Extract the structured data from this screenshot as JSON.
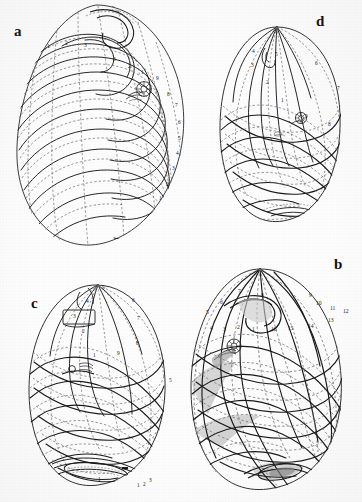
{
  "figure": {
    "kind": "scientific-illustration-plate",
    "background_color": "#ffffff",
    "line_color": "#1a1a1a",
    "dashed_line_color": "#6b6b6b",
    "shade_color": "#9a9a9a"
  },
  "panels": [
    {
      "id": "a",
      "letter": "a",
      "letter_x": 14,
      "letter_y": 31,
      "view": "apical-oblique",
      "labels": [
        {
          "text": "1",
          "x": 47,
          "y": 48
        },
        {
          "text": "2",
          "x": 65,
          "y": 45
        },
        {
          "text": "3",
          "x": 84,
          "y": 47
        },
        {
          "text": "3",
          "x": 113,
          "y": 61
        },
        {
          "text": "2",
          "x": 128,
          "y": 68
        },
        {
          "text": "1",
          "x": 141,
          "y": 74
        },
        {
          "text": "9",
          "x": 156,
          "y": 80
        },
        {
          "text": "8",
          "x": 167,
          "y": 96
        },
        {
          "text": "7",
          "x": 175,
          "y": 107
        },
        {
          "text": "6",
          "x": 178,
          "y": 124
        },
        {
          "text": "5",
          "x": 178,
          "y": 140
        },
        {
          "text": "4",
          "x": 176,
          "y": 155
        },
        {
          "text": "3",
          "x": 172,
          "y": 170
        },
        {
          "text": "2",
          "x": 166,
          "y": 186
        },
        {
          "text": "1",
          "x": 159,
          "y": 200
        }
      ]
    },
    {
      "id": "d",
      "letter": "d",
      "letter_x": 318,
      "letter_y": 28,
      "view": "lateral-upper",
      "labels": [
        {
          "text": "4",
          "x": 252,
          "y": 53
        },
        {
          "text": "5",
          "x": 275,
          "y": 56
        },
        {
          "text": "3",
          "x": 251,
          "y": 67
        },
        {
          "text": "2",
          "x": 266,
          "y": 84
        },
        {
          "text": "1",
          "x": 281,
          "y": 102
        },
        {
          "text": "6",
          "x": 315,
          "y": 65
        },
        {
          "text": "7",
          "x": 337,
          "y": 90
        },
        {
          "text": "8",
          "x": 328,
          "y": 126
        },
        {
          "text": "9",
          "x": 305,
          "y": 118
        }
      ]
    },
    {
      "id": "c",
      "letter": "c",
      "letter_x": 32,
      "letter_y": 304,
      "view": "lateral-left",
      "labels": [
        {
          "text": "5",
          "x": 104,
          "y": 289
        },
        {
          "text": "4",
          "x": 88,
          "y": 303
        },
        {
          "text": "3",
          "x": 75,
          "y": 318
        },
        {
          "text": "2",
          "x": 84,
          "y": 333
        },
        {
          "text": "1",
          "x": 95,
          "y": 357
        },
        {
          "text": "6",
          "x": 134,
          "y": 302
        },
        {
          "text": "7",
          "x": 139,
          "y": 320
        },
        {
          "text": "8",
          "x": 138,
          "y": 345
        },
        {
          "text": "9",
          "x": 119,
          "y": 355
        },
        {
          "text": "5",
          "x": 171,
          "y": 382
        },
        {
          "text": "1",
          "x": 100,
          "y": 481
        },
        {
          "text": "1",
          "x": 139,
          "y": 487
        },
        {
          "text": "2",
          "x": 145,
          "y": 486
        },
        {
          "text": "3",
          "x": 151,
          "y": 482
        }
      ]
    },
    {
      "id": "b",
      "letter": "b",
      "letter_x": 336,
      "letter_y": 265,
      "view": "lateral-right",
      "labels": [
        {
          "text": "7",
          "x": 238,
          "y": 293
        },
        {
          "text": "8",
          "x": 261,
          "y": 297
        },
        {
          "text": "6",
          "x": 220,
          "y": 304
        },
        {
          "text": "5",
          "x": 206,
          "y": 314
        },
        {
          "text": "4",
          "x": 210,
          "y": 330
        },
        {
          "text": "3",
          "x": 223,
          "y": 331
        },
        {
          "text": "2",
          "x": 237,
          "y": 329
        },
        {
          "text": "1",
          "x": 252,
          "y": 331
        },
        {
          "text": "9",
          "x": 309,
          "y": 297
        },
        {
          "text": "10",
          "x": 318,
          "y": 305
        },
        {
          "text": "11",
          "x": 332,
          "y": 310
        },
        {
          "text": "12",
          "x": 345,
          "y": 313
        },
        {
          "text": "13",
          "x": 330,
          "y": 322
        },
        {
          "text": "14",
          "x": 310,
          "y": 328
        },
        {
          "text": "15",
          "x": 290,
          "y": 330
        },
        {
          "text": "16",
          "x": 273,
          "y": 331
        }
      ]
    }
  ]
}
